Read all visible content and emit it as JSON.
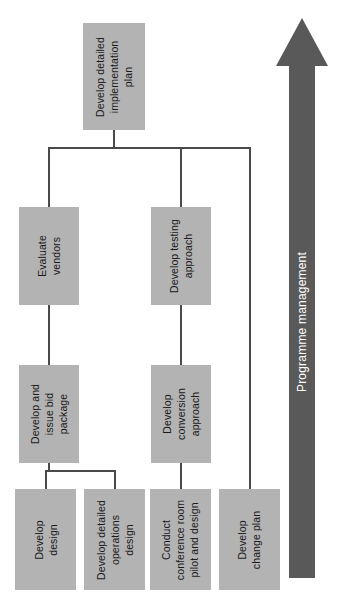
{
  "diagram": {
    "type": "hierarchy-tree",
    "orientation": "rotated-90-ccw",
    "colors": {
      "box_fill": "#b3b3b3",
      "box_text": "#1a1a1a",
      "connector": "#4a4a4a",
      "arrow_fill": "#595959",
      "arrow_text": "#ffffff",
      "background": "#ffffff"
    },
    "nodes": {
      "root": {
        "id": "develop-detailed-implementation-plan",
        "label": "Develop detailed implementation plan",
        "lines": [
          "Develop detailed",
          "implementation",
          "plan"
        ]
      },
      "evaluate_vendors": {
        "id": "evaluate-vendors",
        "label": "Evaluate vendors",
        "lines": [
          "Evaluate",
          "vendors"
        ]
      },
      "develop_testing_approach": {
        "id": "develop-testing-approach",
        "label": "Develop testing approach",
        "lines": [
          "Develop testing",
          "approach"
        ]
      },
      "develop_and_issue_bid_package": {
        "id": "develop-and-issue-bid-package",
        "label": "Develop and issue bid package",
        "lines": [
          "Develop and",
          "issue bid",
          "package"
        ]
      },
      "develop_conversion_approach": {
        "id": "develop-conversion-approach",
        "label": "Develop conversion approach",
        "lines": [
          "Develop",
          "conversion",
          "approach"
        ]
      },
      "develop_design": {
        "id": "develop-design",
        "label": "Develop design",
        "lines": [
          "Develop",
          "design"
        ]
      },
      "develop_detailed_operations_design": {
        "id": "develop-detailed-operations-design",
        "label": "Develop detailed operations design",
        "lines": [
          "Develop detailed",
          "operations",
          "design"
        ]
      },
      "conduct_conference_room_pilot_and_design": {
        "id": "conduct-conference-room-pilot-and-design",
        "label": "Conduct conference room pilot and design",
        "lines": [
          "Conduct",
          "conference room",
          "pilot and design"
        ]
      },
      "develop_change_plan": {
        "id": "develop-change-plan",
        "label": "Develop change plan",
        "lines": [
          "Develop",
          "change plan"
        ]
      }
    },
    "edges": [
      {
        "from": "develop-detailed-implementation-plan",
        "to": "evaluate-vendors"
      },
      {
        "from": "develop-detailed-implementation-plan",
        "to": "develop-testing-approach"
      },
      {
        "from": "develop-detailed-implementation-plan",
        "to": "develop-change-plan"
      },
      {
        "from": "evaluate-vendors",
        "to": "develop-and-issue-bid-package"
      },
      {
        "from": "develop-and-issue-bid-package",
        "to": "develop-design"
      },
      {
        "from": "develop-and-issue-bid-package",
        "to": "develop-detailed-operations-design"
      },
      {
        "from": "develop-testing-approach",
        "to": "develop-conversion-approach"
      },
      {
        "from": "develop-conversion-approach",
        "to": "conduct-conference-room-pilot-and-design"
      }
    ],
    "arrow": {
      "id": "programme-management-arrow",
      "label": "Programme management",
      "direction": "up"
    }
  }
}
